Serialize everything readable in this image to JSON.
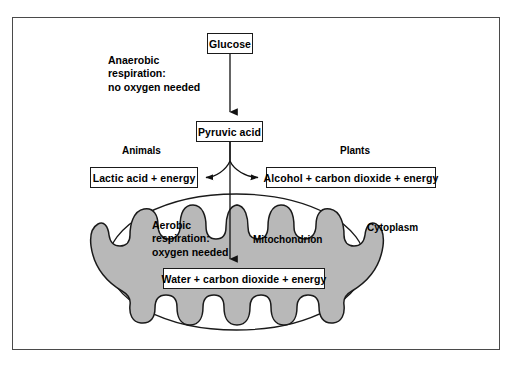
{
  "diagram": {
    "frame": {
      "visible": true,
      "border_color": "#4a4a4a"
    },
    "colors": {
      "matrix_fill": "#b8b8b8",
      "cristae_fill": "#ffffff",
      "outline": "#1a1a1a",
      "frame": "#4a4a4a",
      "text": "#000000",
      "box_fill": "#ffffff"
    },
    "nodes": [
      {
        "id": "glucose",
        "label": "Glucose"
      },
      {
        "id": "pyruvic",
        "label": "Pyruvic acid"
      },
      {
        "id": "lactic",
        "label": "Lactic acid + energy"
      },
      {
        "id": "alcohol",
        "label": "Alcohol + carbon dioxide + energy"
      },
      {
        "id": "water",
        "label": "Water + carbon dioxide + energy"
      }
    ],
    "labels": {
      "anaerobic": "Anaerobic\nrespiration:\nno oxygen needed",
      "animals": "Animals",
      "plants": "Plants",
      "aerobic": "Aerobic\nrespiration:\noxygen needed",
      "mitochondrion": "Mitochondrion",
      "cytoplasm": "Cytoplasm"
    },
    "arrows": [
      {
        "id": "glucose-to-pyruvic",
        "from": "glucose",
        "to": "pyruvic",
        "style": "straight-down",
        "head": "filled-triangle"
      },
      {
        "id": "pyruvic-to-lactic",
        "from": "pyruvic",
        "to": "lactic",
        "style": "curved-left",
        "head": "filled-triangle"
      },
      {
        "id": "pyruvic-to-alcohol",
        "from": "pyruvic",
        "to": "alcohol",
        "style": "curved-right",
        "head": "filled-triangle"
      },
      {
        "id": "pyruvic-to-water",
        "from": "pyruvic",
        "to": "water",
        "style": "straight-down",
        "head": "filled-triangle"
      }
    ],
    "organelle": {
      "name": "mitochondrion",
      "outer_membrane": true,
      "inner_membrane_cristae": true,
      "cristae_count": 18
    }
  }
}
